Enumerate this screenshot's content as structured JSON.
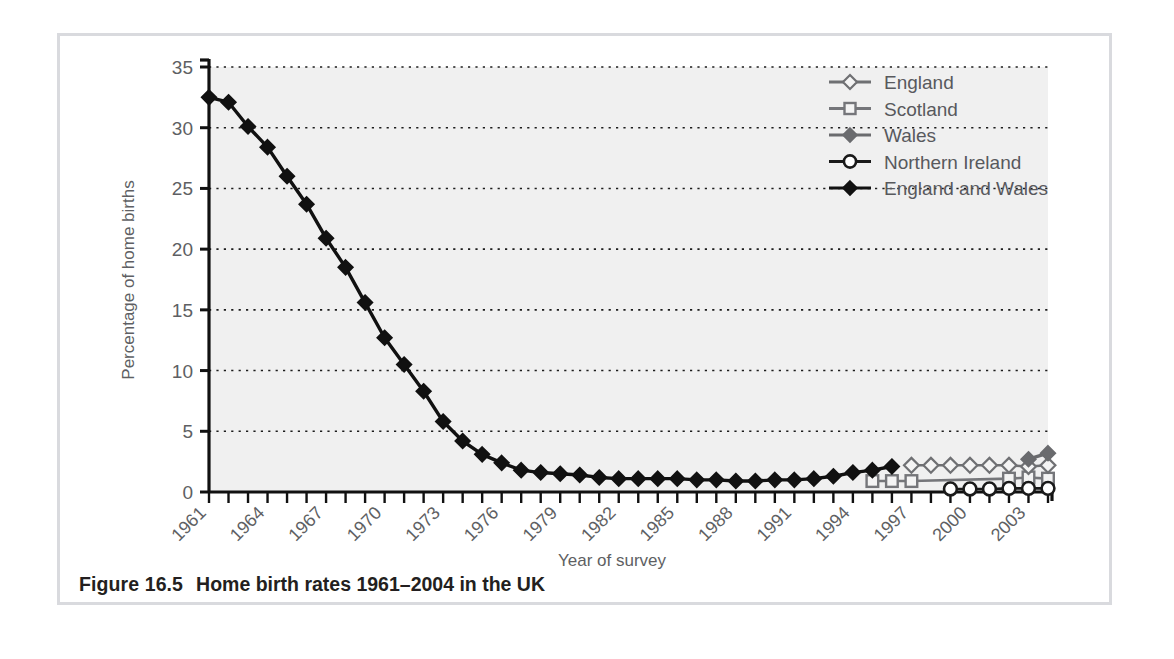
{
  "caption": {
    "figure_number": "Figure 16.5",
    "text": "Home birth rates 1961–2004 in the UK"
  },
  "chart_data": {
    "type": "line",
    "title": "",
    "xlabel": "Year of survey",
    "ylabel": "Percentage of home births",
    "xlim": [
      1961,
      2004
    ],
    "ylim": [
      0,
      35
    ],
    "yticks": [
      0,
      5,
      10,
      15,
      20,
      25,
      30,
      35
    ],
    "ytick_labels": [
      "0",
      "5",
      "10",
      "15",
      "20",
      "25",
      "30",
      "35"
    ],
    "xticks_all": [
      1961,
      1962,
      1963,
      1964,
      1965,
      1966,
      1967,
      1968,
      1969,
      1970,
      1971,
      1972,
      1973,
      1974,
      1975,
      1976,
      1977,
      1978,
      1979,
      1980,
      1981,
      1982,
      1983,
      1984,
      1985,
      1986,
      1987,
      1988,
      1989,
      1990,
      1991,
      1992,
      1993,
      1994,
      1995,
      1996,
      1997,
      1998,
      1999,
      2000,
      2001,
      2002,
      2003,
      2004
    ],
    "xtick_labels": [
      "1961",
      "1964",
      "1967",
      "1970",
      "1973",
      "1976",
      "1979",
      "1982",
      "1985",
      "1988",
      "1991",
      "1994",
      "1997",
      "2000",
      "2003"
    ],
    "xtick_labelled_years": [
      1961,
      1964,
      1967,
      1970,
      1973,
      1976,
      1979,
      1982,
      1985,
      1988,
      1991,
      1994,
      1997,
      2000,
      2003
    ],
    "grid": "horizontal-dotted",
    "legend_position": "top-right",
    "plot_background": "#f0f0f0",
    "series": [
      {
        "name": "England",
        "marker": "open-diamond",
        "color": "#6f7073",
        "fill": "#f4f4f4",
        "x": [
          1997,
          1998,
          1999,
          2000,
          2001,
          2002,
          2003,
          2004
        ],
        "y": [
          2.2,
          2.2,
          2.2,
          2.2,
          2.2,
          2.2,
          2.1,
          2.2
        ]
      },
      {
        "name": "Scotland",
        "marker": "open-square",
        "color": "#75767a",
        "fill": "#f4f4f4",
        "x": [
          1995,
          1996,
          1997,
          2002,
          2003,
          2004
        ],
        "y": [
          0.9,
          0.9,
          0.9,
          1.1,
          1.2,
          1.1
        ]
      },
      {
        "name": "Wales",
        "marker": "filled-diamond",
        "color": "#6a6b6e",
        "fill": "#6a6b6e",
        "x": [
          2003,
          2004
        ],
        "y": [
          2.7,
          3.2
        ]
      },
      {
        "name": "Northern Ireland",
        "marker": "open-circle",
        "color": "#1a1a1a",
        "fill": "#ffffff",
        "x": [
          1999,
          2000,
          2001,
          2002,
          2003,
          2004
        ],
        "y": [
          0.25,
          0.25,
          0.25,
          0.3,
          0.3,
          0.3
        ]
      },
      {
        "name": "England and Wales",
        "marker": "filled-diamond",
        "color": "#111111",
        "fill": "#111111",
        "x": [
          1961,
          1962,
          1963,
          1964,
          1965,
          1966,
          1967,
          1968,
          1969,
          1970,
          1971,
          1972,
          1973,
          1974,
          1975,
          1976,
          1977,
          1978,
          1979,
          1980,
          1981,
          1982,
          1983,
          1984,
          1985,
          1986,
          1987,
          1988,
          1989,
          1990,
          1991,
          1992,
          1993,
          1994,
          1995,
          1996
        ],
        "y": [
          32.5,
          32.1,
          30.1,
          28.4,
          26.0,
          23.7,
          20.9,
          18.5,
          15.6,
          12.7,
          10.5,
          8.3,
          5.8,
          4.2,
          3.1,
          2.4,
          1.8,
          1.6,
          1.5,
          1.4,
          1.2,
          1.1,
          1.1,
          1.1,
          1.1,
          1.0,
          1.0,
          0.9,
          0.9,
          1.0,
          1.0,
          1.1,
          1.3,
          1.6,
          1.8,
          2.1
        ]
      }
    ]
  }
}
